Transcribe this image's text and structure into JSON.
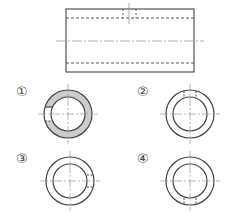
{
  "diagram": {
    "type": "technical-drawing",
    "front_view": {
      "description": "Rectangular front view of a hollow cylinder with a small radial hole at top",
      "colors": {
        "stroke": "#555555",
        "hidden": "#666666",
        "center": "#999999"
      }
    },
    "options": [
      {
        "label": "①",
        "description": "Ring with shaded section and notch on left"
      },
      {
        "label": "②",
        "description": "Ring with hidden hole lines at top"
      },
      {
        "label": "③",
        "description": "Ring with hidden hole lines at right"
      },
      {
        "label": "④",
        "description": "Ring with hidden hole lines at bottom"
      }
    ],
    "section_fill": "#cccccc"
  }
}
